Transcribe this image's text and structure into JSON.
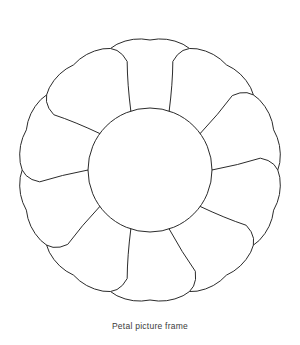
{
  "canvas": {
    "width": 300,
    "height": 345,
    "background": "#ffffff"
  },
  "figure": {
    "name": "petal-picture-frame",
    "stroke_color": "#2b2b2b",
    "fill_color": "#ffffff",
    "stroke_width": 1,
    "center_x": 150,
    "center_y": 170,
    "petal_count": 10,
    "inner_radius": 62,
    "outer_radius": 130,
    "start_angle_deg": -90,
    "petal_shoulder_ratio": 0.72,
    "petal_tip_round": 0.42,
    "petal_half_angle_deg": 18
  },
  "caption": {
    "text": "Petal picture frame",
    "color": "#3a3a3a",
    "font_size_px": 8.5
  }
}
